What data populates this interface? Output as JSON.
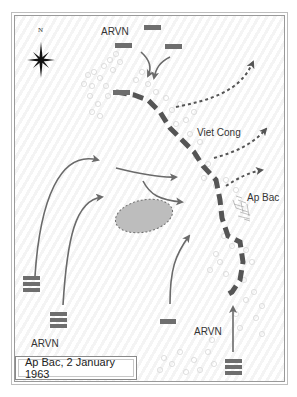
{
  "map": {
    "title": "Ap Bac, 2 January 1963",
    "compass": {
      "icon": "compass-rose-icon",
      "north_label": "N"
    },
    "labels": {
      "arvn_north": "ARVN",
      "viet_cong": "Viet Cong",
      "ap_bac": "Ap Bac",
      "arvn_southwest": "ARVN",
      "arvn_south": "ARVN"
    },
    "colors": {
      "unit": "#6e6e6e",
      "arrow": "#6a6a6a",
      "vc_line": "#555555",
      "marsh_fill": "#bdbdbd",
      "tree_outline": "#d6d6d6"
    },
    "legend": {
      "unit_markers": "gray rectangles (ARVN units)",
      "dashed_heavy_line": "Viet Cong positions",
      "dotted_arrows": "Viet Cong withdrawal",
      "solid_arrows": "ARVN movements"
    }
  }
}
